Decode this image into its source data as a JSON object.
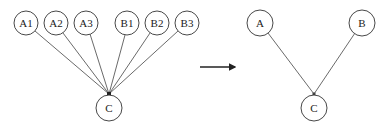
{
  "diagram": {
    "left_graph": {
      "nodes": [
        {
          "id": "A1",
          "label": "A1",
          "x": 26,
          "y": 23
        },
        {
          "id": "A2",
          "label": "A2",
          "x": 56,
          "y": 23
        },
        {
          "id": "A3",
          "label": "A3",
          "x": 86,
          "y": 23
        },
        {
          "id": "B1",
          "label": "B1",
          "x": 127,
          "y": 23
        },
        {
          "id": "B2",
          "label": "B2",
          "x": 157,
          "y": 23
        },
        {
          "id": "B3",
          "label": "B3",
          "x": 187,
          "y": 23
        },
        {
          "id": "C",
          "label": "C",
          "x": 109,
          "y": 108
        }
      ],
      "edges": [
        [
          "A1",
          "C"
        ],
        [
          "A2",
          "C"
        ],
        [
          "A3",
          "C"
        ],
        [
          "B1",
          "C"
        ],
        [
          "B2",
          "C"
        ],
        [
          "B3",
          "C"
        ]
      ]
    },
    "transform_arrow": {
      "direction": "right"
    },
    "right_graph": {
      "nodes": [
        {
          "id": "A",
          "label": "A",
          "x": 260,
          "y": 23
        },
        {
          "id": "B",
          "label": "B",
          "x": 362,
          "y": 23
        },
        {
          "id": "C",
          "label": "C",
          "x": 314,
          "y": 108
        }
      ],
      "edges": [
        [
          "A",
          "C"
        ],
        [
          "B",
          "C"
        ]
      ]
    }
  }
}
